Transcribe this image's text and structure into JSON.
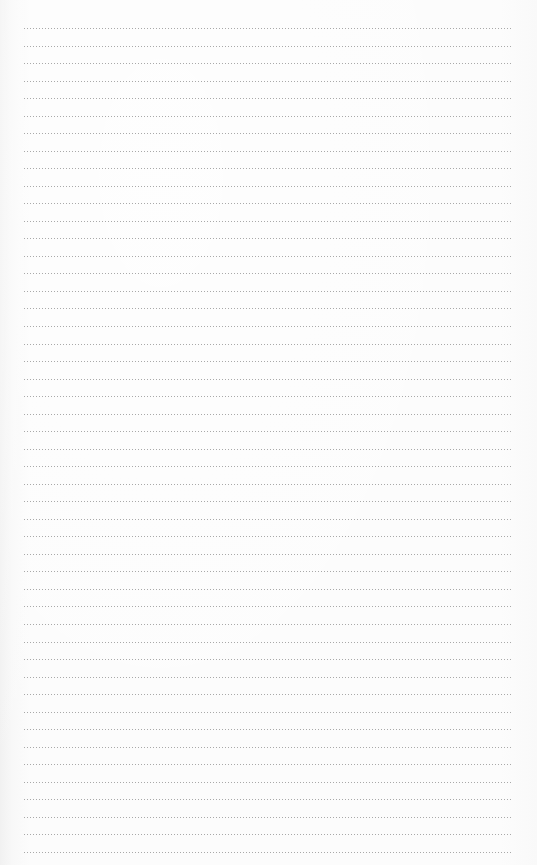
{
  "page": {
    "type": "lined-paper",
    "background_color": "#fbfbfb",
    "rule_color": "#9a9a9a",
    "rule_style": "dotted"
  },
  "rules": {
    "count": 48,
    "first_y": 28,
    "spacing": 17.53,
    "left": 24,
    "right": 512
  },
  "text_content": []
}
